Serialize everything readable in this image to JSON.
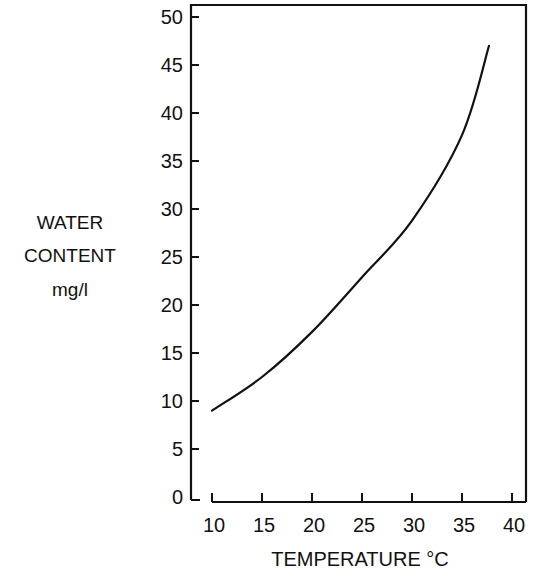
{
  "chart_data": {
    "type": "line",
    "title": "",
    "xlabel": "TEMPERATURE °C",
    "ylabel": [
      "WATER",
      "CONTENT",
      "mg/l"
    ],
    "xlim": [
      10,
      40
    ],
    "ylim": [
      0,
      50
    ],
    "x_ticks": [
      10,
      15,
      20,
      25,
      30,
      35,
      40
    ],
    "x_tick_labels": [
      "10",
      "15",
      "20",
      "25",
      "30",
      "35",
      "40"
    ],
    "y_ticks": [
      0,
      5,
      10,
      15,
      20,
      25,
      30,
      35,
      40,
      45,
      50
    ],
    "y_tick_labels": [
      "0",
      "5",
      "10",
      "15",
      "20",
      "25",
      "30",
      "35",
      "40",
      "45",
      "50"
    ],
    "grid": false,
    "legend": null,
    "series": [
      {
        "name": "Water content",
        "x": [
          10,
          15,
          20,
          25,
          30,
          35,
          37.7
        ],
        "values": [
          9.0,
          12.5,
          17.2,
          22.9,
          28.8,
          37.7,
          47.0
        ]
      }
    ]
  },
  "colors": {
    "line": "#111111",
    "axis": "#111111",
    "background": "#ffffff"
  }
}
